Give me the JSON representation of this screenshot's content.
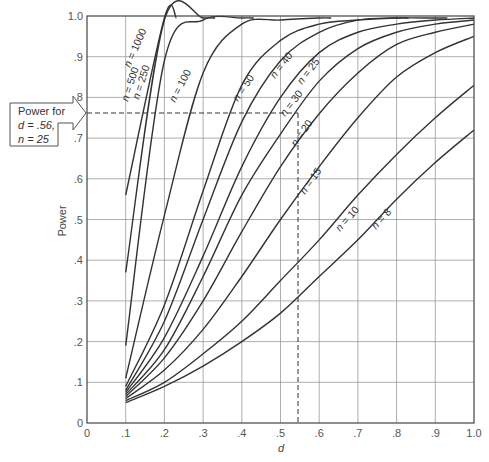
{
  "chart_data": {
    "type": "line",
    "title": "",
    "xlabel": "d",
    "ylabel": "Power",
    "xlim": [
      0,
      1.0
    ],
    "ylim": [
      0,
      1.0
    ],
    "grid": true,
    "x_ticks": [
      "0",
      ".1",
      ".2",
      ".3",
      ".4",
      ".5",
      ".6",
      ".7",
      ".8",
      ".9",
      "1.0"
    ],
    "y_ticks": [
      "0",
      ".1",
      ".2",
      ".3",
      ".4",
      ".5",
      ".6",
      ".7",
      ".8",
      ".9",
      "1.0"
    ],
    "x": [
      0.1,
      0.2,
      0.3,
      0.4,
      0.5,
      0.6,
      0.7,
      0.8,
      0.9,
      1.0
    ],
    "series": [
      {
        "name": "n = 1000",
        "values": [
          0.56,
          1.0,
          null,
          null,
          null,
          null,
          null,
          null,
          null,
          null
        ]
      },
      {
        "name": "n = 500",
        "values": [
          0.37,
          0.99,
          1.0,
          null,
          null,
          null,
          null,
          null,
          null,
          null
        ]
      },
      {
        "name": "n = 250",
        "values": [
          0.19,
          0.89,
          0.99,
          1.0,
          null,
          null,
          null,
          null,
          null,
          null
        ]
      },
      {
        "name": "n = 100",
        "values": [
          0.11,
          0.51,
          0.86,
          0.98,
          0.99,
          1.0,
          null,
          null,
          null,
          null
        ]
      },
      {
        "name": "n = 50",
        "values": [
          0.09,
          0.29,
          0.57,
          0.83,
          0.94,
          0.98,
          0.99,
          1.0,
          null,
          null
        ]
      },
      {
        "name": "n = 40",
        "values": [
          0.08,
          0.25,
          0.5,
          0.74,
          0.89,
          0.96,
          0.99,
          0.995,
          1.0,
          null
        ]
      },
      {
        "name": "n = 30",
        "values": [
          0.075,
          0.21,
          0.41,
          0.63,
          0.8,
          0.91,
          0.96,
          0.98,
          0.99,
          1.0
        ]
      },
      {
        "name": "n = 25",
        "values": [
          0.07,
          0.18,
          0.36,
          0.56,
          0.71,
          0.84,
          0.92,
          0.96,
          0.98,
          0.99
        ]
      },
      {
        "name": "n = 20",
        "values": [
          0.065,
          0.16,
          0.3,
          0.47,
          0.63,
          0.76,
          0.86,
          0.93,
          0.96,
          0.98
        ]
      },
      {
        "name": "n = 15",
        "values": [
          0.06,
          0.13,
          0.23,
          0.36,
          0.5,
          0.63,
          0.75,
          0.85,
          0.91,
          0.95
        ]
      },
      {
        "name": "n = 10",
        "values": [
          0.055,
          0.1,
          0.17,
          0.25,
          0.35,
          0.45,
          0.56,
          0.66,
          0.75,
          0.83
        ]
      },
      {
        "name": "n = 8",
        "values": [
          0.05,
          0.09,
          0.14,
          0.2,
          0.27,
          0.36,
          0.45,
          0.55,
          0.64,
          0.72
        ]
      }
    ],
    "annotations": [
      {
        "text": "Power for d = .56, n = 25",
        "x": 0.56,
        "y": 0.76,
        "style": "dashed reference lines with arrow callout"
      }
    ]
  },
  "axes": {
    "xlabel": "d",
    "ylabel": "Power"
  },
  "callout": {
    "line1": "Power for",
    "line2": "d = .56,",
    "line3": "n = 25"
  },
  "curve_labels": [
    "n = 1000",
    "n = 500",
    "n = 250",
    "n = 100",
    "n = 50",
    "n = 40",
    "n = 30",
    "n = 25",
    "n = 20",
    "n = 15",
    "n = 10",
    "n = 8"
  ]
}
